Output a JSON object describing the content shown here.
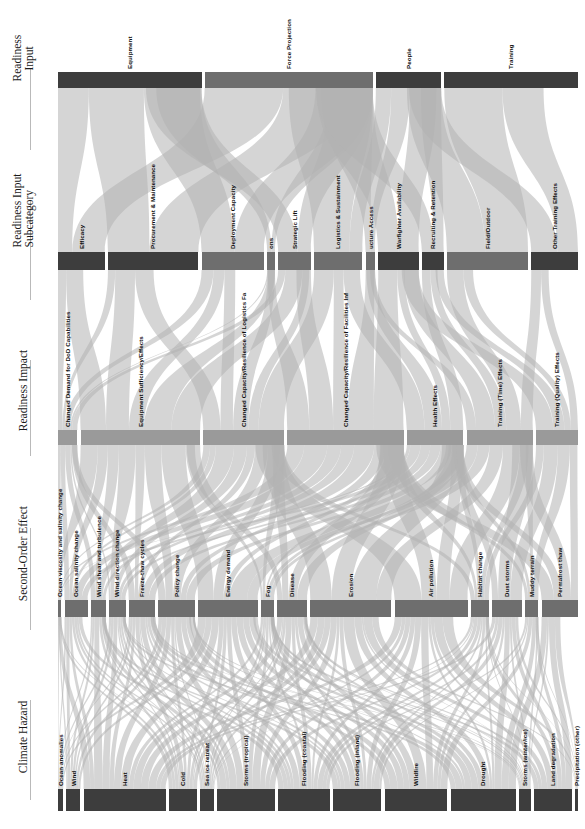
{
  "figure": {
    "type": "sankey",
    "orientation": "vertical-rotated",
    "flow_direction": "bottom-to-top",
    "stage_axis_labels": [
      {
        "id": "climate-hazard",
        "lines": [
          "Climate Hazard"
        ]
      },
      {
        "id": "second-order-effect",
        "lines": [
          "Second-Order Effect"
        ]
      },
      {
        "id": "readiness-impact",
        "lines": [
          "Readiness Impact"
        ]
      },
      {
        "id": "readiness-input-subcategory",
        "lines": [
          "Readiness Input",
          "Subcategory"
        ]
      },
      {
        "id": "readiness-input",
        "lines": [
          "Readiness",
          "Input"
        ]
      }
    ],
    "colors": {
      "node_dark": "#3d3d3d",
      "node_mid": "#6e6e6e",
      "node_light": "#9a9a9a",
      "link": "#b3b3b3",
      "link_dark": "#8a8a8a",
      "background": "#ffffff",
      "text": "#0d0d0d",
      "rule": "#b9b9b9"
    }
  },
  "chart_data": {
    "type": "sankey",
    "title": "",
    "stages": [
      "Climate Hazard",
      "Second-Order Effect",
      "Readiness Impact",
      "Readiness Input Subcategory",
      "Readiness Input"
    ],
    "nodes": {
      "climate_hazard": [
        {
          "label": "Ocean anomalies",
          "value": 4
        },
        {
          "label": "Wind",
          "value": 11
        },
        {
          "label": "Heat",
          "value": 64
        },
        {
          "label": "Cold",
          "value": 22
        },
        {
          "label": "Sea ice retreat",
          "value": 11
        },
        {
          "label": "Storms (tropical)",
          "value": 45
        },
        {
          "label": "Flooding (coastal)",
          "value": 40
        },
        {
          "label": "Flooding (inland)",
          "value": 38
        },
        {
          "label": "Wildfire",
          "value": 49
        },
        {
          "label": "Drought",
          "value": 51
        },
        {
          "label": "Storms (winter/ice)",
          "value": 9
        },
        {
          "label": "Land degradation",
          "value": 30
        },
        {
          "label": "Precipitation (other)",
          "value": 2
        }
      ],
      "second_order_effect": [
        {
          "label": "Ocean viscosity and salinity change",
          "value": 2
        },
        {
          "label": "Ocean salinity change",
          "value": 14
        },
        {
          "label": "Wind shear and turbulence",
          "value": 9
        },
        {
          "label": "Wind direction change",
          "value": 10
        },
        {
          "label": "Freeze-thaw cycles",
          "value": 16
        },
        {
          "label": "Policy change",
          "value": 22
        },
        {
          "label": "Energy demand",
          "value": 36
        },
        {
          "label": "Fog",
          "value": 8
        },
        {
          "label": "Disease",
          "value": 18
        },
        {
          "label": "Erosion",
          "value": 49
        },
        {
          "label": "Air pollution",
          "value": 44
        },
        {
          "label": "Habitat change",
          "value": 11
        },
        {
          "label": "Dust storms",
          "value": 18
        },
        {
          "label": "Muddy terrain",
          "value": 8
        },
        {
          "label": "Permafrost thaw",
          "value": 22
        }
      ],
      "readiness_impact": [
        {
          "label": "Changed Demand for DoD Capabilities",
          "value": 12
        },
        {
          "label": "Equipment Sufficiency/Effects",
          "value": 74
        },
        {
          "label": "Changed Capacity/Resilience of Logistics Fa",
          "value": 50
        },
        {
          "label": "Changed Capacity/Resilience of Facilities Inf",
          "value": 72
        },
        {
          "label": "Health Effects",
          "value": 35
        },
        {
          "label": "Training (Time) Effects",
          "value": 41
        },
        {
          "label": "Training (Quality) Effects",
          "value": 26
        }
      ],
      "readiness_input_subcategory": [
        {
          "label": "Efficacy",
          "value": 30
        },
        {
          "label": "Procurement & Maintenance",
          "value": 58
        },
        {
          "label": "Deployment Capacity",
          "value": 40
        },
        {
          "label": "ons",
          "value": 5
        },
        {
          "label": "Strategic Lift",
          "value": 21
        },
        {
          "label": "Logistics & Sustainment",
          "value": 31
        },
        {
          "label": "ucture Access",
          "value": 6
        },
        {
          "label": "Warfighter Availability",
          "value": 26
        },
        {
          "label": "Recruiting & Retention",
          "value": 14
        },
        {
          "label": "Field/Outdoor",
          "value": 52
        },
        {
          "label": "Other Training Effects",
          "value": 30
        }
      ],
      "readiness_input": [
        {
          "label": "Equipment",
          "value": 88
        },
        {
          "label": "Force Projection",
          "value": 103
        },
        {
          "label": "People",
          "value": 40
        },
        {
          "label": "Training",
          "value": 82
        }
      ]
    }
  }
}
